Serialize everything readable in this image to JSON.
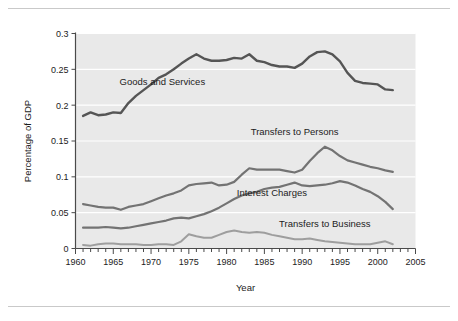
{
  "figure": {
    "background_color": "#ffffff",
    "plot_background_color": "#e9e9e9",
    "gridline_color": "#ffffff",
    "axis_color": "#4a4a4a",
    "top_rule": true,
    "bottom_rule": true
  },
  "axis_titles": {
    "x": "Year",
    "y": "Percentage of GDP"
  },
  "y_tick_labels": [
    "0",
    "0.05",
    "0.1",
    "0.15",
    "0.2",
    "0.25",
    "0.3"
  ],
  "x_tick_labels": [
    "1960",
    "1965",
    "1970",
    "1975",
    "1980",
    "1985",
    "1990",
    "1995",
    "2000",
    "2005"
  ],
  "series_labels": {
    "goods_and_services": "Goods and Services",
    "transfers_to_persons": "Transfers to Persons",
    "interest_charges": "Interest Charges",
    "transfers_to_business": "Transfers to Business"
  },
  "chart_data": {
    "type": "line",
    "title": "",
    "subtitle": "",
    "xlabel": "Year",
    "ylabel": "Percentage of GDP",
    "xlim": [
      1960,
      2005
    ],
    "ylim": [
      0,
      0.3
    ],
    "y_ticks": [
      0,
      0.05,
      0.1,
      0.15,
      0.2,
      0.25,
      0.3
    ],
    "x_ticks": [
      1960,
      1965,
      1970,
      1975,
      1980,
      1985,
      1990,
      1995,
      2000,
      2005
    ],
    "x_minor_tick_interval": 1,
    "grid": "horizontal",
    "legend": "inline-labels",
    "x": [
      1961,
      1962,
      1963,
      1964,
      1965,
      1966,
      1967,
      1968,
      1969,
      1970,
      1971,
      1972,
      1973,
      1974,
      1975,
      1976,
      1977,
      1978,
      1979,
      1980,
      1981,
      1982,
      1983,
      1984,
      1985,
      1986,
      1987,
      1988,
      1989,
      1990,
      1991,
      1992,
      1993,
      1994,
      1995,
      1996,
      1997,
      1998,
      1999,
      2000,
      2001,
      2002
    ],
    "series": [
      {
        "name": "Goods and Services",
        "color": "#555555",
        "width": 2.4,
        "label_x": 1971.5,
        "label_y": 0.228,
        "values": [
          0.185,
          0.19,
          0.186,
          0.187,
          0.19,
          0.189,
          0.203,
          0.213,
          0.221,
          0.229,
          0.238,
          0.243,
          0.25,
          0.258,
          0.265,
          0.271,
          0.265,
          0.262,
          0.262,
          0.263,
          0.266,
          0.265,
          0.271,
          0.262,
          0.26,
          0.256,
          0.254,
          0.254,
          0.252,
          0.258,
          0.268,
          0.274,
          0.275,
          0.271,
          0.261,
          0.245,
          0.234,
          0.231,
          0.23,
          0.229,
          0.222,
          0.221
        ]
      },
      {
        "name": "Transfers to Persons",
        "color": "#737373",
        "width": 2.2,
        "label_x": 1989.0,
        "label_y": 0.158,
        "values": [
          0.062,
          0.06,
          0.058,
          0.057,
          0.057,
          0.054,
          0.058,
          0.06,
          0.062,
          0.066,
          0.07,
          0.074,
          0.077,
          0.081,
          0.088,
          0.09,
          0.091,
          0.092,
          0.088,
          0.089,
          0.093,
          0.103,
          0.112,
          0.11,
          0.11,
          0.11,
          0.11,
          0.108,
          0.106,
          0.11,
          0.122,
          0.133,
          0.142,
          0.137,
          0.129,
          0.123,
          0.12,
          0.117,
          0.114,
          0.112,
          0.109,
          0.107
        ]
      },
      {
        "name": "Interest Charges",
        "color": "#737373",
        "width": 2.2,
        "label_x": 1986.0,
        "label_y": 0.073,
        "values": [
          0.029,
          0.029,
          0.029,
          0.03,
          0.029,
          0.028,
          0.029,
          0.031,
          0.033,
          0.035,
          0.037,
          0.039,
          0.042,
          0.043,
          0.042,
          0.045,
          0.048,
          0.052,
          0.057,
          0.063,
          0.069,
          0.074,
          0.077,
          0.079,
          0.083,
          0.085,
          0.086,
          0.089,
          0.092,
          0.088,
          0.087,
          0.088,
          0.089,
          0.091,
          0.094,
          0.092,
          0.088,
          0.083,
          0.079,
          0.073,
          0.065,
          0.055
        ]
      },
      {
        "name": "Transfers to Business",
        "color": "#9e9e9e",
        "width": 2.0,
        "label_x": 1993.0,
        "label_y": 0.03,
        "values": [
          0.005,
          0.004,
          0.006,
          0.007,
          0.007,
          0.006,
          0.006,
          0.006,
          0.005,
          0.005,
          0.006,
          0.006,
          0.005,
          0.01,
          0.02,
          0.017,
          0.015,
          0.015,
          0.019,
          0.023,
          0.025,
          0.023,
          0.022,
          0.023,
          0.022,
          0.019,
          0.017,
          0.015,
          0.013,
          0.013,
          0.014,
          0.012,
          0.01,
          0.009,
          0.008,
          0.007,
          0.006,
          0.006,
          0.006,
          0.008,
          0.01,
          0.006
        ]
      }
    ]
  }
}
